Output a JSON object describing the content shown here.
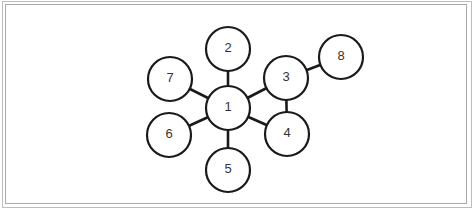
{
  "diagram": {
    "type": "graph",
    "nodes": [
      {
        "id": "1",
        "label": "1",
        "x": 228,
        "y": 108
      },
      {
        "id": "2",
        "label": "2",
        "x": 228,
        "y": 49
      },
      {
        "id": "3",
        "label": "3",
        "x": 286,
        "y": 78
      },
      {
        "id": "4",
        "label": "4",
        "x": 287,
        "y": 134
      },
      {
        "id": "5",
        "label": "5",
        "x": 228,
        "y": 170
      },
      {
        "id": "6",
        "label": "6",
        "x": 169,
        "y": 135
      },
      {
        "id": "7",
        "label": "7",
        "x": 170,
        "y": 79
      },
      {
        "id": "8",
        "label": "8",
        "x": 341,
        "y": 57
      }
    ],
    "edges": [
      [
        "1",
        "2"
      ],
      [
        "1",
        "3"
      ],
      [
        "1",
        "4"
      ],
      [
        "1",
        "5"
      ],
      [
        "1",
        "6"
      ],
      [
        "1",
        "7"
      ],
      [
        "3",
        "4"
      ],
      [
        "3",
        "8"
      ]
    ],
    "node_radius": 22
  }
}
